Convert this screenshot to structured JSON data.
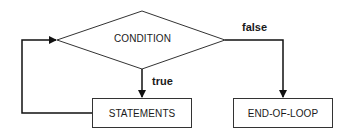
{
  "diagram": {
    "type": "flowchart",
    "title": "",
    "nodes": [
      {
        "id": "condition",
        "shape": "diamond",
        "label": "CONDITION"
      },
      {
        "id": "statements",
        "shape": "rectangle",
        "label": "STATEMENTS"
      },
      {
        "id": "end",
        "shape": "rectangle",
        "label": "END-OF-LOOP"
      }
    ],
    "edges": [
      {
        "from": "condition",
        "to": "statements",
        "label": "true"
      },
      {
        "from": "condition",
        "to": "end",
        "label": "false"
      },
      {
        "from": "statements",
        "to": "condition",
        "label": ""
      }
    ]
  },
  "labels": {
    "condition": "CONDITION",
    "statements": "STATEMENTS",
    "end": "END-OF-LOOP",
    "true": "true",
    "false": "false"
  },
  "colors": {
    "stroke": "#333333",
    "text": "#1a1a1a",
    "background": "#ffffff"
  }
}
